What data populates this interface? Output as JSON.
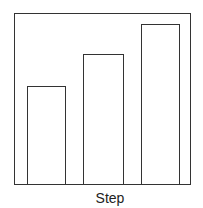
{
  "chart_data": {
    "type": "bar",
    "title": "",
    "xlabel": "Step",
    "ylabel": "",
    "categories": [
      "1",
      "2",
      "3"
    ],
    "values": [
      55,
      75,
      92
    ],
    "ylim": [
      0,
      100
    ],
    "grid": false,
    "legend": null
  },
  "bars": [
    {
      "left": 12,
      "width": 39,
      "height": 98
    },
    {
      "left": 68,
      "width": 41,
      "height": 130
    },
    {
      "left": 126,
      "width": 39,
      "height": 160
    }
  ]
}
